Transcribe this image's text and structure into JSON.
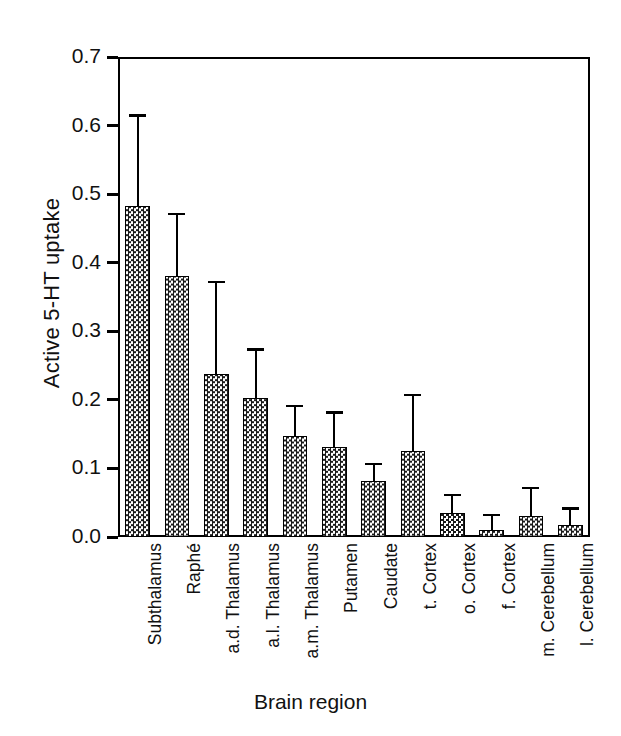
{
  "chart_data": {
    "type": "bar",
    "title": "",
    "xlabel": "Brain region",
    "ylabel": "Active 5-HT uptake",
    "ylim": [
      0.0,
      0.7
    ],
    "yticks": [
      "0.0",
      "0.1",
      "0.2",
      "0.3",
      "0.4",
      "0.5",
      "0.6",
      "0.7"
    ],
    "ytick_values": [
      0.0,
      0.1,
      0.2,
      0.3,
      0.4,
      0.5,
      0.6,
      0.7
    ],
    "grid": false,
    "legend": "none",
    "error_bars": "upper only",
    "bar_fill": "checkerboard hatch",
    "categories": [
      "Subthalamus",
      "Raphé",
      "a.d. Thalamus",
      "a.l. Thalamus",
      "a.m. Thalamus",
      "Putamen",
      "Caudate",
      "t. Cortex",
      "o. Cortex",
      "f. Cortex",
      "m. Cerebellum",
      "l. Cerebellum"
    ],
    "values": [
      0.483,
      0.38,
      0.238,
      0.203,
      0.148,
      0.131,
      0.081,
      0.125,
      0.035,
      0.01,
      0.03,
      0.017
    ],
    "errors_upper": [
      0.13,
      0.09,
      0.132,
      0.069,
      0.042,
      0.049,
      0.024,
      0.08,
      0.025,
      0.02,
      0.04,
      0.023
    ],
    "error_tops": [
      0.613,
      0.47,
      0.37,
      0.272,
      0.19,
      0.18,
      0.105,
      0.205,
      0.06,
      0.03,
      0.07,
      0.04
    ]
  },
  "colors": {
    "axis": "#000000",
    "bar_fill_dark": "#1a1a1a",
    "bar_fill_light": "#ffffff",
    "background": "#ffffff"
  }
}
